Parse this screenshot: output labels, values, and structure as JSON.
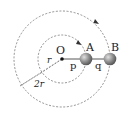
{
  "diagram": {
    "center_label": "O",
    "ball_a_label": "A",
    "ball_b_label": "B",
    "segment_p_label": "p",
    "segment_q_label": "q",
    "radius_small_label": "r",
    "radius_large_label": "2r",
    "colors": {
      "line": "#555555",
      "dashed": "#777777",
      "ball": "#8a8a8a",
      "ball_highlight": "#d0d0d0",
      "text": "#222222"
    }
  }
}
